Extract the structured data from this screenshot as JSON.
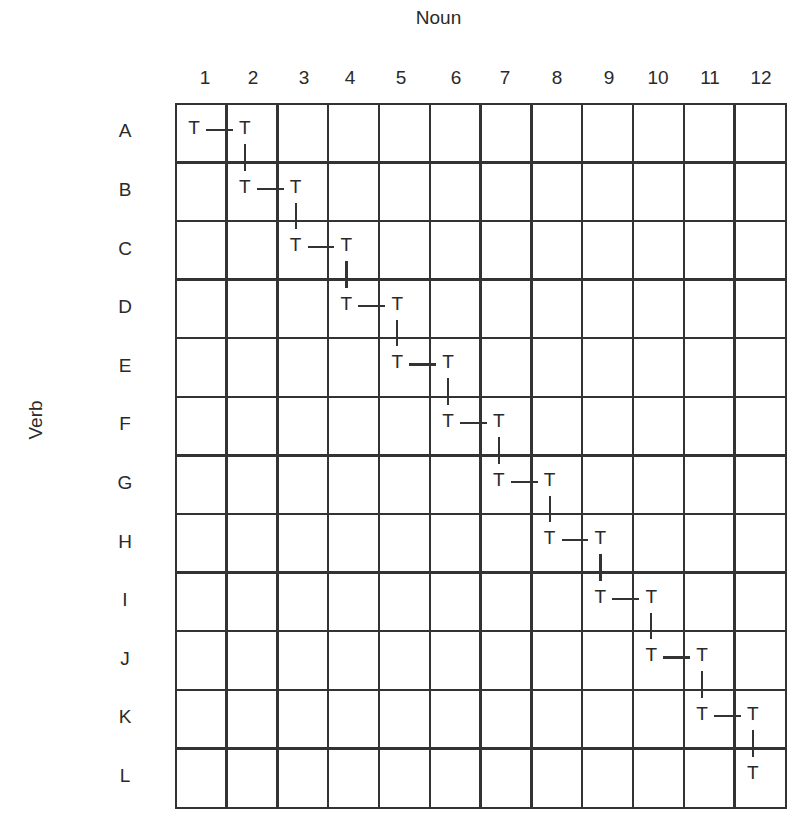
{
  "diagram": {
    "x_axis_title": "Noun",
    "y_axis_title": "Verb",
    "columns": [
      "1",
      "2",
      "3",
      "4",
      "5",
      "6",
      "7",
      "8",
      "9",
      "10",
      "11",
      "12"
    ],
    "rows": [
      "A",
      "B",
      "C",
      "D",
      "E",
      "F",
      "G",
      "H",
      "I",
      "J",
      "K",
      "L"
    ],
    "cell_symbol": "T",
    "marks": [
      {
        "row": "A",
        "cols": [
          "1",
          "2"
        ]
      },
      {
        "row": "B",
        "cols": [
          "2",
          "3"
        ]
      },
      {
        "row": "C",
        "cols": [
          "3",
          "4"
        ]
      },
      {
        "row": "D",
        "cols": [
          "4",
          "5"
        ]
      },
      {
        "row": "E",
        "cols": [
          "5",
          "6"
        ]
      },
      {
        "row": "F",
        "cols": [
          "6",
          "7"
        ]
      },
      {
        "row": "G",
        "cols": [
          "7",
          "8"
        ]
      },
      {
        "row": "H",
        "cols": [
          "8",
          "9"
        ]
      },
      {
        "row": "I",
        "cols": [
          "9",
          "10"
        ]
      },
      {
        "row": "J",
        "cols": [
          "10",
          "11"
        ]
      },
      {
        "row": "K",
        "cols": [
          "11",
          "12"
        ]
      },
      {
        "row": "L",
        "cols": [
          "12"
        ]
      }
    ],
    "line_color": "#333333",
    "text_color": "#2a2a2a"
  }
}
